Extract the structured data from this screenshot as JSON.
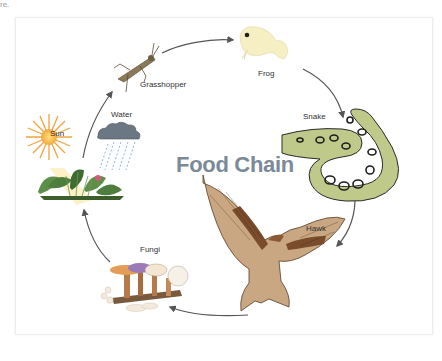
{
  "title": "Food Chain",
  "corner_text": "re.",
  "nodes": [
    {
      "id": "sun",
      "label": "Sun"
    },
    {
      "id": "water",
      "label": "Water"
    },
    {
      "id": "grasshopper",
      "label": "Grasshopper"
    },
    {
      "id": "frog",
      "label": "Frog"
    },
    {
      "id": "snake",
      "label": "Snake"
    },
    {
      "id": "hawk",
      "label": "Hawk"
    },
    {
      "id": "fungi",
      "label": "Fungi"
    }
  ],
  "flow": [
    "plants",
    "grasshopper",
    "frog",
    "snake",
    "hawk",
    "fungi",
    "plants"
  ],
  "colors": {
    "title": "#7b8a98",
    "arrow": "#555555",
    "frame_border": "#ececec"
  }
}
